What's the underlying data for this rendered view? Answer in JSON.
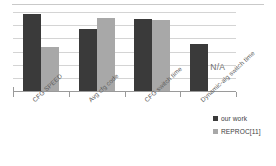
{
  "chart_data": {
    "type": "bar",
    "title": "",
    "subtitle": "",
    "xlabel": "",
    "ylabel": "",
    "grid": true,
    "gridline_count": 7,
    "axis_tick_labels": [],
    "ylim": [
      0,
      1.05
    ],
    "legend_position": "right",
    "categories": [
      "CFG SPEED",
      "Avg cfg code",
      "CFG switch time",
      "Dynamic-alg switch time"
    ],
    "series": [
      {
        "name": "our work",
        "color": "#3a3a3a",
        "values": [
          1.02,
          0.83,
          0.96,
          0.63
        ]
      },
      {
        "name": "REPROC[11]",
        "color": "#a8a8a8",
        "values": [
          0.59,
          0.97,
          0.94,
          null
        ]
      }
    ],
    "annotations": [
      {
        "text": "N/A",
        "category": "Dynamic-alg switch time",
        "series": "REPROC[11]"
      }
    ]
  },
  "legend": {
    "items": [
      {
        "label": "our work",
        "color": "#3a3a3a"
      },
      {
        "label": "REPROC[11]",
        "color": "#a8a8a8"
      }
    ]
  },
  "colors": {
    "series_a": "#3a3a3a",
    "series_b": "#a8a8a8",
    "gridline": "#d4d4d4",
    "axis": "#9a9a9a",
    "annotation_text": "#6e6e6e",
    "background": "#ffffff"
  }
}
